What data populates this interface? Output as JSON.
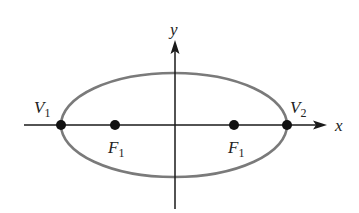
{
  "diagram": {
    "type": "ellipse-with-foci",
    "colors": {
      "axis": "#1a1a1a",
      "ellipse": "#7a7a7a",
      "point": "#111111",
      "text": "#222222"
    },
    "axes": {
      "x_label": "x",
      "y_label": "y"
    },
    "ellipse": {
      "cx": 174,
      "cy": 125,
      "rx": 113,
      "ry": 52
    },
    "points": [
      {
        "id": "V1",
        "label": "V",
        "subscript": "1",
        "x": 61,
        "y": 125,
        "label_pos": "above-left"
      },
      {
        "id": "F1-left",
        "label": "F",
        "subscript": "1",
        "x": 115,
        "y": 125,
        "label_pos": "below"
      },
      {
        "id": "F1-right",
        "label": "F",
        "subscript": "1",
        "x": 234,
        "y": 125,
        "label_pos": "below"
      },
      {
        "id": "V2",
        "label": "V",
        "subscript": "2",
        "x": 287,
        "y": 125,
        "label_pos": "above-right"
      }
    ]
  }
}
